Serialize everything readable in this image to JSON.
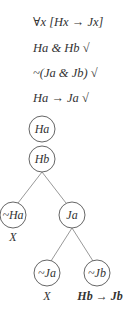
{
  "premises": [
    {
      "text": "∀x [Hx → Jx]",
      "checked": false
    },
    {
      "text": "Ha & Hb",
      "checked": true
    },
    {
      "text": "~(Ja & Jb)",
      "checked": true
    },
    {
      "text": "Ha → Ja",
      "checked": true
    }
  ],
  "check_mark": "√",
  "tree": {
    "nodes": [
      {
        "id": "ha",
        "label": "Ha"
      },
      {
        "id": "hb",
        "label": "Hb"
      },
      {
        "id": "not-ha",
        "label": "~Ha"
      },
      {
        "id": "ja",
        "label": "Ja"
      },
      {
        "id": "not-ja",
        "label": "~Ja"
      },
      {
        "id": "not-jb",
        "label": "~Jb"
      }
    ],
    "closed_mark": "X",
    "annotation": "Hb → Jb"
  }
}
